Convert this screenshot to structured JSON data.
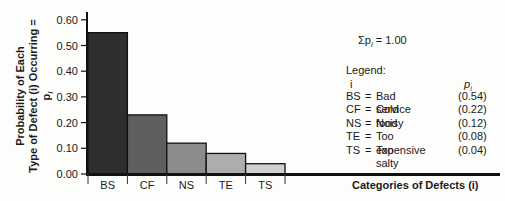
{
  "chart_data": {
    "type": "bar",
    "title": "",
    "xlabel": "Categories of Defects (i)",
    "ylabel_line1": "Probability of Each",
    "ylabel_line2": "Type of Defect (i) Occurring = p",
    "ylabel_sub": "i",
    "categories": [
      "BS",
      "CF",
      "NS",
      "TE",
      "TS"
    ],
    "values": [
      0.54,
      0.22,
      0.12,
      0.08,
      0.04
    ],
    "bar_heights": [
      0.55,
      0.23,
      0.12,
      0.08,
      0.04
    ],
    "bar_colors": [
      "#2e2e2e",
      "#5f5f5f",
      "#8c8c8c",
      "#adadad",
      "#cfcfcf"
    ],
    "yticks": [
      "0.00",
      "0.10",
      "0.20",
      "0.30",
      "0.40",
      "0.50",
      "0.60"
    ],
    "ylim": [
      0,
      0.6
    ],
    "grid": false,
    "annotation": {
      "sum_symbol": "Σp",
      "sum_sub": "i",
      "sum_value": " = 1.00"
    },
    "legend": {
      "title": "Legend:",
      "col_i": "i",
      "col_p": "p",
      "col_p_sub": "i",
      "entries": [
        {
          "code": "BS",
          "eq": "=",
          "name": "Bad service",
          "p": "(0.54)"
        },
        {
          "code": "CF",
          "eq": "=",
          "name": "Cold food",
          "p": "(0.22)"
        },
        {
          "code": "NS",
          "eq": "=",
          "name": "Noisy",
          "p": "(0.12)"
        },
        {
          "code": "TE",
          "eq": "=",
          "name": "Too expensive",
          "p": "(0.08)"
        },
        {
          "code": "TS",
          "eq": "=",
          "name": "Too salty",
          "p": "(0.04)"
        }
      ]
    }
  }
}
